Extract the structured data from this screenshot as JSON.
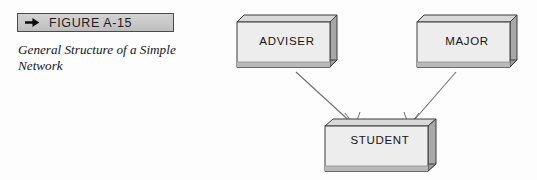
{
  "figure": {
    "label": "FIGURE A-15",
    "arrow_icon": "right-arrow-icon",
    "caption": "General Structure of a Simple Network"
  },
  "diagram": {
    "type": "network-data-model",
    "notation": "crow's-foot",
    "entities": [
      {
        "id": "adviser",
        "label": "ADVISER",
        "position": "top-left"
      },
      {
        "id": "major",
        "label": "MAJOR",
        "position": "top-right"
      },
      {
        "id": "student",
        "label": "STUDENT",
        "position": "bottom-center"
      }
    ],
    "connections": [
      {
        "from": "adviser",
        "to": "student"
      },
      {
        "from": "major",
        "to": "student"
      }
    ]
  },
  "colors": {
    "label_bar_fill": "#c9c9c9",
    "label_bar_border": "#4a4a4a",
    "box_face": "#ededed",
    "box_top": "#d8d8d8",
    "box_side": "#a8a8a8",
    "box_bottom": "#909090",
    "outline": "#3d3d3d",
    "connector": "#6e6e6e",
    "text": "#141414",
    "background": "#fdfdfd"
  }
}
